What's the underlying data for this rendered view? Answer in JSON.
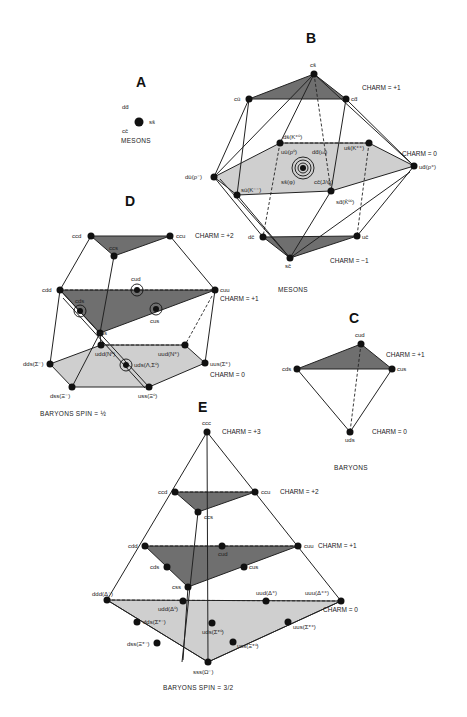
{
  "panels": {
    "A": {
      "letter": "A",
      "caption": "MESONS",
      "labels": {
        "dd": "dd̄",
        "ss": "ss̄",
        "cc": "cc̄"
      }
    },
    "B": {
      "letter": "B",
      "caption": "MESONS",
      "charm_labels": {
        "plus1": "CHARM = +1",
        "zero": "CHARM = 0",
        "minus1": "CHARM = −1"
      },
      "labels": {
        "cs": "cs̄",
        "cu": "cū",
        "cd": "cd̄",
        "ds": "ds̄(K⁺⁰)",
        "us": "us̄(K⁺⁺)",
        "du": "dū(ρ⁻)",
        "ud": "ud̄(ρ⁺)",
        "su": "sū(K⁻⁻)",
        "sd": "sd̄(K̄⁰⁰)",
        "uu": "uū(ρ⁰)",
        "dd": "dd̄(ω)",
        "ss": "ss̄(φ)",
        "cc": "cc̄(J/ψ)",
        "dc": "dc̄",
        "uc": "uc̄",
        "sc": "sc̄"
      }
    },
    "C": {
      "letter": "C",
      "caption": "BARYONS",
      "charm_labels": {
        "plus1": "CHARM = +1",
        "zero": "CHARM = 0"
      },
      "labels": {
        "cud": "cud",
        "cds": "cds",
        "cus": "cus",
        "uds": "uds"
      }
    },
    "D": {
      "letter": "D",
      "caption": "BARYONS  SPIN = ½",
      "charm_labels": {
        "plus2": "CHARM = +2",
        "plus1": "CHARM = +1",
        "zero": "CHARM = 0"
      },
      "labels": {
        "ccd": "ccd",
        "ccu": "ccu",
        "ccs": "ccs",
        "cdd": "cdd",
        "cud": "cud",
        "cuu": "cuu",
        "cds": "cds",
        "cus": "cus",
        "css": "css",
        "udd": "udd(N⁰)",
        "uud": "uud(N⁺)",
        "dds": "dds(Σ⁻)",
        "uus": "uus(Σ⁺)",
        "uds": "uds(Λ,Σ⁰)",
        "dss": "dss(Ξ⁻)",
        "uss": "uss(Ξ⁰)"
      }
    },
    "E": {
      "letter": "E",
      "caption": "BARYONS  SPIN = 3/2",
      "charm_labels": {
        "plus3": "CHARM = +3",
        "plus2": "CHARM = +2",
        "plus1": "CHARM = +1",
        "zero": "CHARM = 0"
      },
      "labels": {
        "ccc": "ccc",
        "ccd": "ccd",
        "ccu": "ccu",
        "ccs": "ccs",
        "cdd": "cdd",
        "cud": "cud",
        "cuu": "cuu",
        "cds": "cds",
        "cus": "cus",
        "css": "css",
        "ddd": "ddd(Δ⁻)",
        "udd": "udd(Δ⁰)",
        "uud": "uud(Δ⁺)",
        "uuu": "uuu(Δ⁺⁺)",
        "dds": "dds(Σ*⁻)",
        "uds": "uds(Σ*⁰)",
        "uus": "uus(Σ*⁺)",
        "dss": "dss(Ξ*⁻)",
        "uss": "uss(Ξ*⁰)",
        "sss": "sss(Ω⁻)"
      }
    }
  }
}
